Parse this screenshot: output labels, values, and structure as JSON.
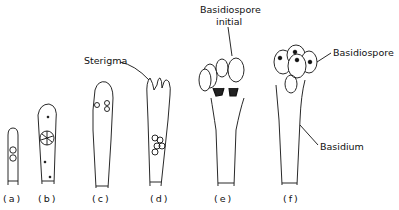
{
  "diagram": {
    "stages": [
      {
        "id": "a",
        "label": "(a)"
      },
      {
        "id": "b",
        "label": "(b)"
      },
      {
        "id": "c",
        "label": "(c)"
      },
      {
        "id": "d",
        "label": "(d)"
      },
      {
        "id": "e",
        "label": "(e)"
      },
      {
        "id": "f",
        "label": "(f)"
      }
    ],
    "annotations": {
      "sterigma": "Sterigma",
      "basidiospore_initial_line1": "Basidiospore",
      "basidiospore_initial_line2": "initial",
      "basidiospore": "Basidiospore",
      "basidium": "Basidium"
    },
    "colors": {
      "ink": "#111111",
      "background": "#ffffff"
    }
  }
}
